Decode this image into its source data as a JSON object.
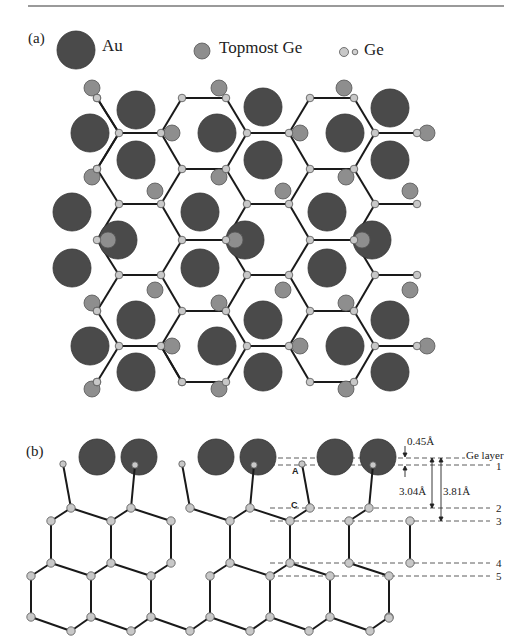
{
  "figure": {
    "panel_a": {
      "label": "(a)",
      "legend": [
        {
          "name": "Au",
          "glyph": "large-dark-circle"
        },
        {
          "name": "Topmost Ge",
          "glyph": "medium-gray-circle"
        },
        {
          "name": "Ge",
          "glyph": "small-light-circles"
        }
      ]
    },
    "panel_b": {
      "label": "(b)",
      "atom_labels": {
        "A": "A",
        "C": "C"
      },
      "dimensions": {
        "d1": "0.45Å",
        "d2": "3.04Å",
        "d3": "3.81Å"
      },
      "layer_labels": [
        "Ge layer",
        "1",
        "2",
        "3",
        "4",
        "5"
      ]
    }
  },
  "colors": {
    "au": "#4a4a4a",
    "topmost_ge": "#8e8e8e",
    "ge": "#c8c8c8",
    "bond": "#1a1a1a",
    "rule": "#9a9a9a"
  }
}
